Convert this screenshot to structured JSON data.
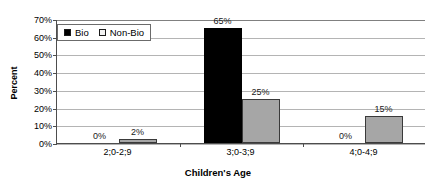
{
  "chart_data": {
    "type": "bar",
    "title": "",
    "xlabel": "Children's Age",
    "ylabel": "Percent",
    "categories": [
      "2;0-2;9",
      "3;0-3;9",
      "4;0-4;9"
    ],
    "series": [
      {
        "name": "Bio",
        "values": [
          0,
          65,
          0
        ],
        "color": "#000000"
      },
      {
        "name": "Non-Bio",
        "values": [
          2,
          25,
          15
        ],
        "color": "#a6a6a6"
      }
    ],
    "value_labels": [
      [
        "0%",
        "2%"
      ],
      [
        "65%",
        "25%"
      ],
      [
        "0%",
        "15%"
      ]
    ],
    "ylim": [
      0,
      70
    ],
    "ytick_values": [
      0,
      10,
      20,
      30,
      40,
      50,
      60,
      70
    ],
    "ytick_labels": [
      "0%",
      "10%",
      "20%",
      "30%",
      "40%",
      "50%",
      "60%",
      "70%"
    ],
    "grid": true,
    "legend_position": "top-left",
    "legend_entries": [
      "Bio",
      "Non-Bio"
    ]
  },
  "legend": {
    "bio": {
      "label": "Bio",
      "swatch_name": "legend-swatch-bio"
    },
    "nonbio": {
      "label": "Non-Bio",
      "swatch_name": "legend-swatch-non-bio"
    }
  },
  "axes": {
    "y_title": "Percent",
    "x_title": "Children's Age"
  }
}
